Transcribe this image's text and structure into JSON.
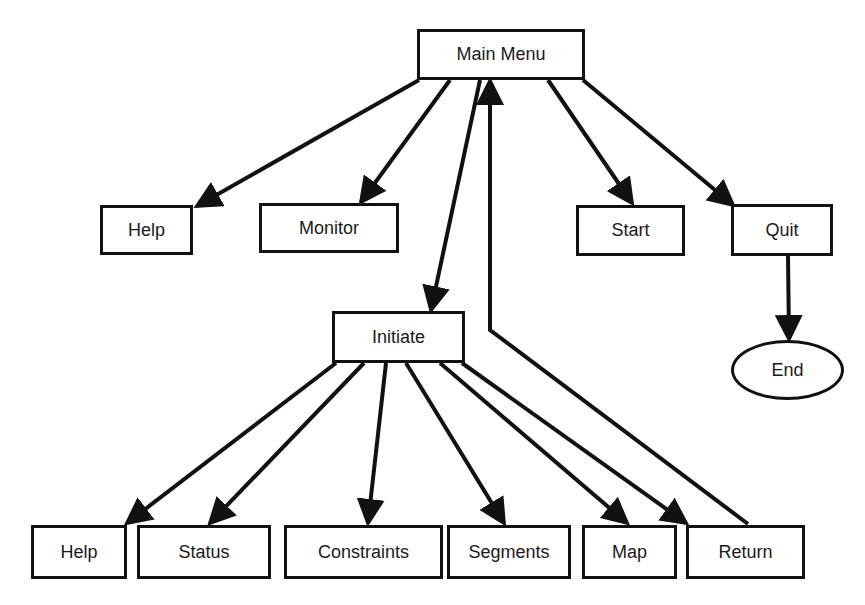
{
  "diagram": {
    "type": "menu-hierarchy-flowchart",
    "colors": {
      "stroke": "#111111",
      "background": "#ffffff",
      "text": "#1a1a1a"
    },
    "nodes": [
      {
        "id": "main_menu",
        "label": "Main Menu",
        "shape": "rect",
        "x": 417,
        "y": 29,
        "w": 168,
        "h": 51
      },
      {
        "id": "help_top",
        "label": "Help",
        "shape": "rect",
        "x": 100,
        "y": 205,
        "w": 93,
        "h": 50
      },
      {
        "id": "monitor",
        "label": "Monitor",
        "shape": "rect",
        "x": 259,
        "y": 203,
        "w": 140,
        "h": 50
      },
      {
        "id": "start",
        "label": "Start",
        "shape": "rect",
        "x": 576,
        "y": 205,
        "w": 109,
        "h": 51
      },
      {
        "id": "quit",
        "label": "Quit",
        "shape": "rect",
        "x": 731,
        "y": 204,
        "w": 102,
        "h": 52
      },
      {
        "id": "end",
        "label": "End",
        "shape": "ellipse",
        "x": 731,
        "y": 340,
        "w": 113,
        "h": 60
      },
      {
        "id": "initiate",
        "label": "Initiate",
        "shape": "rect",
        "x": 332,
        "y": 311,
        "w": 133,
        "h": 52
      },
      {
        "id": "help_bottom",
        "label": "Help",
        "shape": "rect",
        "x": 31,
        "y": 525,
        "w": 96,
        "h": 54
      },
      {
        "id": "status",
        "label": "Status",
        "shape": "rect",
        "x": 137,
        "y": 525,
        "w": 134,
        "h": 54
      },
      {
        "id": "constraints",
        "label": "Constraints",
        "shape": "rect",
        "x": 284,
        "y": 525,
        "w": 159,
        "h": 54
      },
      {
        "id": "segments",
        "label": "Segments",
        "shape": "rect",
        "x": 447,
        "y": 525,
        "w": 124,
        "h": 54
      },
      {
        "id": "map",
        "label": "Map",
        "shape": "rect",
        "x": 582,
        "y": 525,
        "w": 95,
        "h": 54
      },
      {
        "id": "return",
        "label": "Return",
        "shape": "rect",
        "x": 686,
        "y": 525,
        "w": 119,
        "h": 54
      }
    ],
    "edges": [
      {
        "from": "main_menu",
        "to": "help_top",
        "x1": 419,
        "y1": 80,
        "x2": 197,
        "y2": 206
      },
      {
        "from": "main_menu",
        "to": "monitor",
        "x1": 450,
        "y1": 80,
        "x2": 361,
        "y2": 202
      },
      {
        "from": "main_menu",
        "to": "initiate",
        "x1": 480,
        "y1": 80,
        "x2": 431,
        "y2": 310
      },
      {
        "from": "main_menu",
        "to": "start",
        "x1": 548,
        "y1": 80,
        "x2": 632,
        "y2": 203
      },
      {
        "from": "main_menu",
        "to": "quit",
        "x1": 583,
        "y1": 80,
        "x2": 733,
        "y2": 205
      },
      {
        "from": "quit",
        "to": "end",
        "x1": 788,
        "y1": 256,
        "x2": 789,
        "y2": 339
      },
      {
        "from": "initiate",
        "to": "help_bottom",
        "x1": 336,
        "y1": 363,
        "x2": 127,
        "y2": 523
      },
      {
        "from": "initiate",
        "to": "status",
        "x1": 364,
        "y1": 363,
        "x2": 210,
        "y2": 523
      },
      {
        "from": "initiate",
        "to": "constraints",
        "x1": 386,
        "y1": 363,
        "x2": 368,
        "y2": 523
      },
      {
        "from": "initiate",
        "to": "segments",
        "x1": 406,
        "y1": 363,
        "x2": 504,
        "y2": 523
      },
      {
        "from": "initiate",
        "to": "map",
        "x1": 440,
        "y1": 363,
        "x2": 627,
        "y2": 523
      },
      {
        "from": "initiate",
        "to": "return",
        "x1": 462,
        "y1": 363,
        "x2": 686,
        "y2": 523
      },
      {
        "from": "return",
        "to": "main_menu",
        "x1": 748,
        "y1": 524,
        "x2": 490,
        "y2": 330,
        "via_x": 490,
        "via_y": 330,
        "end_x": 490,
        "end_y": 81
      }
    ]
  }
}
